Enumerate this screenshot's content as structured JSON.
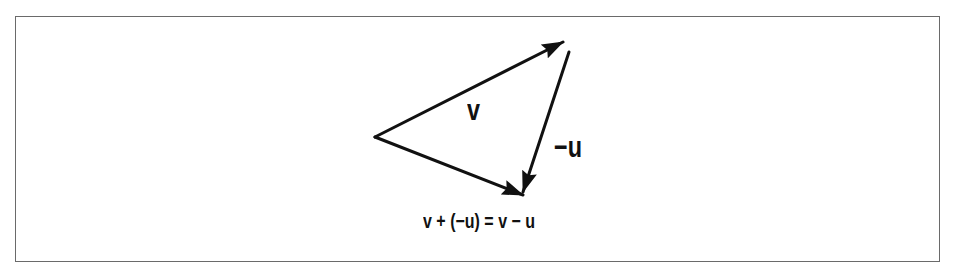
{
  "figure": {
    "type": "vector-subtraction-diagram",
    "colors": {
      "stroke": "#111111",
      "frame": "#6a6a6a",
      "background": "#ffffff"
    },
    "vectors": [
      {
        "name": "v",
        "label": "v",
        "from": [
          375,
          137
        ],
        "to": [
          563,
          42
        ]
      },
      {
        "name": "neg-u",
        "label": "−u",
        "from": [
          569,
          52
        ],
        "to": [
          523,
          192
        ]
      },
      {
        "name": "resultant",
        "label": "v − u",
        "from": [
          375,
          137
        ],
        "to": [
          523,
          195
        ]
      }
    ],
    "labels": {
      "v": "v",
      "neg_u": "−u"
    },
    "caption": "v + (−u) = v − u"
  }
}
